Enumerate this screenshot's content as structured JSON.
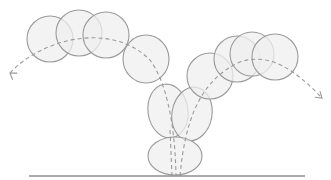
{
  "diagram": {
    "type": "bouncing-ball-trajectory",
    "colors": {
      "background": "#ffffff",
      "ball_fill": "#efefef",
      "ball_stroke": "#9a9a9a",
      "path_stroke": "#9a9a9a",
      "ground": "#8f8f8f"
    },
    "ground": {
      "x1": 29,
      "x2": 305,
      "y": 176
    },
    "balls": [
      {
        "id": "ball-1",
        "cx": 50,
        "cy": 39,
        "rx": 23,
        "ry": 23,
        "rotate": 0
      },
      {
        "id": "ball-2",
        "cx": 79,
        "cy": 33,
        "rx": 23,
        "ry": 23,
        "rotate": 0
      },
      {
        "id": "ball-3",
        "cx": 106,
        "cy": 35,
        "rx": 23,
        "ry": 23,
        "rotate": 0
      },
      {
        "id": "ball-4",
        "cx": 146,
        "cy": 59,
        "rx": 23,
        "ry": 24,
        "rotate": 0
      },
      {
        "id": "ball-5",
        "cx": 168,
        "cy": 111,
        "rx": 20,
        "ry": 27,
        "rotate": -8
      },
      {
        "id": "ball-6",
        "cx": 192,
        "cy": 114,
        "rx": 20,
        "ry": 27,
        "rotate": 10
      },
      {
        "id": "ball-7",
        "cx": 175,
        "cy": 156,
        "rx": 27,
        "ry": 19,
        "rotate": 0
      },
      {
        "id": "ball-8",
        "cx": 210,
        "cy": 76,
        "rx": 23,
        "ry": 23,
        "rotate": 0
      },
      {
        "id": "ball-9",
        "cx": 237,
        "cy": 59,
        "rx": 23,
        "ry": 23,
        "rotate": 0
      },
      {
        "id": "ball-10",
        "cx": 252,
        "cy": 54,
        "rx": 22,
        "ry": 22,
        "rotate": 0
      },
      {
        "id": "ball-11",
        "cx": 275,
        "cy": 57,
        "rx": 23,
        "ry": 23,
        "rotate": 0
      }
    ],
    "paths": {
      "left_arc": "M 10 73 C 40 40, 110 20, 150 60 C 165 80, 175 120, 176 176",
      "down_line": "M 172 176 L 170 130",
      "right_arc": "M 180 176 C 185 120, 200 80, 240 62 C 270 52, 295 70, 322 98"
    },
    "arrows": {
      "left": {
        "x": 10,
        "y": 73,
        "angle": 215
      },
      "right": {
        "x": 322,
        "y": 98,
        "angle": 40
      }
    }
  }
}
